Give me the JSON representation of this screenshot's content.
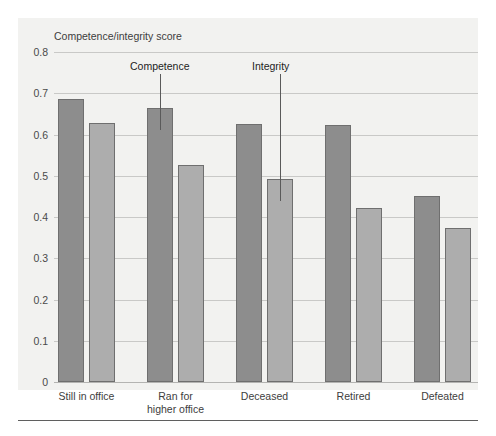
{
  "chart_data": {
    "type": "bar",
    "title": "",
    "ylabel": "Competence/integrity score",
    "xlabel": "",
    "ylim": [
      0,
      0.8
    ],
    "yticks": [
      "0",
      "0.1",
      "0.2",
      "0.3",
      "0.4",
      "0.5",
      "0.6",
      "0.7",
      "0.8"
    ],
    "ytick_values": [
      0,
      0.1,
      0.2,
      0.3,
      0.4,
      0.5,
      0.6,
      0.7,
      0.8
    ],
    "grid": true,
    "legend": "annotations",
    "categories": [
      "Still in office",
      "Ran for\nhigher office",
      "Deceased",
      "Retired",
      "Defeated"
    ],
    "category_lines": [
      [
        "Still in office"
      ],
      [
        "Ran for",
        "higher office"
      ],
      [
        "Deceased"
      ],
      [
        "Retired"
      ],
      [
        "Defeated"
      ]
    ],
    "series": [
      {
        "name": "Competence",
        "color": "#8d8d8d",
        "values": [
          0.685,
          0.665,
          0.625,
          0.622,
          0.452
        ]
      },
      {
        "name": "Integrity",
        "color": "#adadad",
        "values": [
          0.628,
          0.525,
          0.492,
          0.421,
          0.373
        ]
      }
    ],
    "annotations": [
      {
        "text": "Competence",
        "points_to_group": 1,
        "points_to_series": 0
      },
      {
        "text": "Integrity",
        "points_to_group": 2,
        "points_to_series": 1
      }
    ]
  },
  "colors": {
    "panel_background": "#f2f2f0",
    "competence_bar": "#8d8d8d",
    "integrity_bar": "#adadad",
    "bar_outline": "#6f6f6f",
    "gridline": "#c9c9c7",
    "text": "#3d3d3d",
    "rule": "#5f5f5f"
  }
}
